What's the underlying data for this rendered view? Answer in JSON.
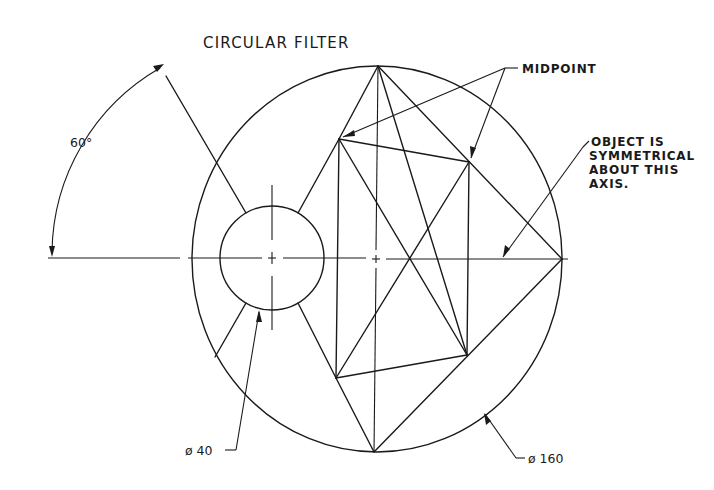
{
  "title": "CIRCULAR FILTER",
  "annotations": {
    "angle": "60°",
    "midpoint": "MIDPOINT",
    "symmetry_note": [
      "OBJECT IS",
      "SYMMETRICAL",
      "ABOUT THIS",
      "AXIS."
    ],
    "small_diameter": "ø 40",
    "large_diameter": "ø 160"
  },
  "geometry": {
    "outer_circle": {
      "cx": 377,
      "cy": 259,
      "rx": 185,
      "ry": 193,
      "diameter": 160
    },
    "inner_circle": {
      "cx": 272,
      "cy": 258,
      "r": 52,
      "diameter": 40
    },
    "points": {
      "top": [
        378,
        66
      ],
      "right": [
        562,
        259
      ],
      "bottom": [
        374,
        452
      ],
      "mid_upper_left": [
        339,
        139
      ],
      "upper_right": [
        469,
        162
      ],
      "lower_left": [
        336,
        378
      ],
      "lower_right": [
        467,
        355
      ],
      "axis_crossing": [
        410,
        259
      ]
    },
    "angle_degrees": 60
  },
  "colors": {
    "line": "#1a1a1a",
    "background": "#ffffff"
  }
}
